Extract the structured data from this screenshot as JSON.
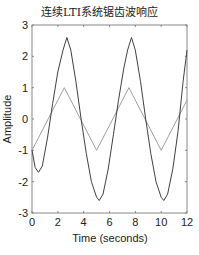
{
  "chart_data": {
    "type": "line",
    "title": "连续LTI系统锯齿波响应",
    "xlabel": "Time (seconds)",
    "ylabel": "Amplitude",
    "xlim": [
      0,
      12
    ],
    "ylim": [
      -3,
      3
    ],
    "xticks": [
      0,
      2,
      4,
      6,
      8,
      10,
      12
    ],
    "yticks": [
      -3,
      -2,
      -1,
      0,
      1,
      2,
      3
    ],
    "grid": false,
    "legend": null,
    "series": [
      {
        "name": "input (triangle/sawtooth wave)",
        "color": "#a0a0a0",
        "x": [
          0,
          2.5,
          5,
          7.5,
          10,
          12
        ],
        "y": [
          -1,
          1,
          -1,
          1,
          -1,
          0.6
        ]
      },
      {
        "name": "system response",
        "color": "#404040",
        "x": [
          0,
          0.25,
          0.5,
          0.8,
          1.2,
          1.6,
          2.0,
          2.4,
          2.7,
          3.0,
          3.4,
          3.8,
          4.2,
          4.6,
          5.0,
          5.2,
          5.5,
          5.9,
          6.3,
          6.7,
          7.1,
          7.4,
          7.7,
          8.0,
          8.4,
          8.8,
          9.2,
          9.6,
          10.0,
          10.2,
          10.5,
          10.9,
          11.3,
          11.7,
          12.0
        ],
        "y": [
          -1.0,
          -1.55,
          -1.7,
          -1.5,
          -0.6,
          0.5,
          1.5,
          2.2,
          2.6,
          2.2,
          1.2,
          0.0,
          -1.1,
          -2.0,
          -2.5,
          -2.6,
          -2.4,
          -1.6,
          -0.5,
          0.6,
          1.6,
          2.2,
          2.6,
          2.2,
          1.2,
          0.0,
          -1.1,
          -2.0,
          -2.5,
          -2.6,
          -2.4,
          -1.6,
          -0.4,
          1.2,
          2.2
        ]
      }
    ]
  }
}
